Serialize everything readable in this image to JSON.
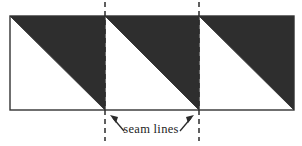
{
  "figure": {
    "caption": "seam lines",
    "colors": {
      "background": "#ffffff",
      "shaded_triangle": "#2e2e2e",
      "outline": "#333333",
      "seam_dash": "#2b2b2b",
      "arrow": "#2b2b2b",
      "text": "#1d1d1d"
    },
    "band": {
      "left": 10,
      "top": 16,
      "right": 294,
      "bottom": 110,
      "square_count": 3,
      "square_boundaries": [
        10,
        105,
        199,
        294
      ]
    },
    "squares": [
      {
        "index": 1,
        "name": "square-left",
        "x_left": 10,
        "x_right": 105,
        "shaded_half": "upper-right",
        "diagonal": "top-left to bottom-right"
      },
      {
        "index": 2,
        "name": "square-middle",
        "x_left": 105,
        "x_right": 199,
        "shaded_half": "upper-right",
        "diagonal": "top-left to bottom-right"
      },
      {
        "index": 3,
        "name": "square-right",
        "x_left": 199,
        "x_right": 294,
        "shaded_half": "upper-right",
        "diagonal": "top-left to bottom-right"
      }
    ],
    "seam_lines": [
      {
        "name": "seam-line-left",
        "x": 105,
        "y_top": 2,
        "y_bottom": 141,
        "style": "dashed"
      },
      {
        "name": "seam-line-right",
        "x": 199,
        "y_top": 2,
        "y_bottom": 141,
        "style": "dashed"
      }
    ],
    "arrows": [
      {
        "name": "arrow-to-left-seam",
        "direction": "up-left",
        "glyph": "northwest-arrow",
        "tail_x": 124,
        "tail_y": 131,
        "head_x": 111,
        "head_y": 116
      },
      {
        "name": "arrow-to-right-seam",
        "direction": "up-right",
        "glyph": "northeast-arrow",
        "tail_x": 180,
        "tail_y": 131,
        "head_x": 193,
        "head_y": 116
      }
    ]
  }
}
